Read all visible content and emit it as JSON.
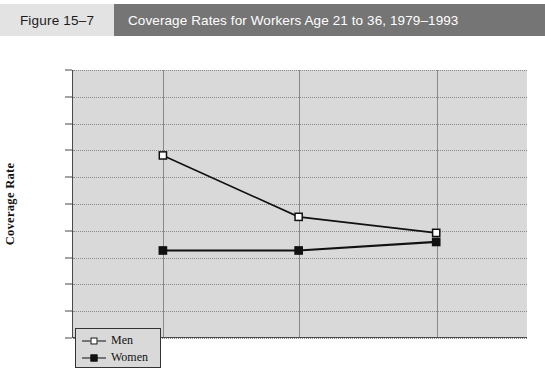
{
  "header": {
    "figure_label": "Figure 15–7",
    "title": "Coverage Rates for Workers Age 21 to 36, 1979–1993",
    "figure_block_color": "#e3e3e3",
    "title_block_color": "#757575",
    "title_text_color": "#ffffff"
  },
  "chart_data": {
    "type": "line",
    "title": "Coverage Rates for Workers Age 21 to 36, 1979–1993",
    "xlabel": "",
    "ylabel": "Coverage Rate",
    "categories": [
      "1979",
      "1988",
      "1993"
    ],
    "x": [
      1979,
      1988,
      1993
    ],
    "series": [
      {
        "name": "Men",
        "values": [
          64.0,
          52.5,
          49.5
        ],
        "marker": "open-square",
        "color": "#111111"
      },
      {
        "name": "Women",
        "values": [
          46.2,
          46.2,
          47.8
        ],
        "marker": "filled-square",
        "color": "#111111"
      }
    ],
    "ylim": [
      30,
      80
    ],
    "yticks": [
      30,
      35,
      40,
      45,
      50,
      55,
      60,
      65,
      70,
      75,
      80
    ],
    "ytick_labels": [
      "30",
      "35",
      "40",
      "45",
      "50",
      "55",
      "60",
      "65",
      "70",
      "75",
      "80"
    ],
    "xtick_labels": [
      "1979",
      "1988",
      "1993"
    ],
    "grid": true,
    "grid_style": "dotted-horizontal-solid-vertical",
    "legend_position": "bottom-left",
    "plot_background": "#d9d9d9",
    "axis_color": "#4a4a4a"
  }
}
